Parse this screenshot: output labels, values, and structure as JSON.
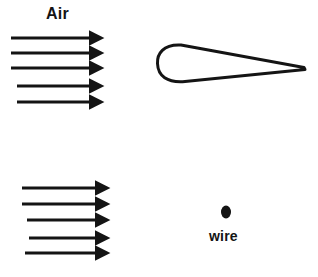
{
  "figure": {
    "width": 318,
    "height": 277,
    "background_color": "#ffffff",
    "ink_color": "#141414",
    "labels": {
      "air": "Air",
      "wire": "wire"
    },
    "icons": {
      "airfoil": "airfoil-outline-icon",
      "wire_dot": "wire-dot-icon",
      "flow_arrow": "flow-arrow-icon"
    },
    "upper_flow": {
      "name": "upper-airflow-arrows",
      "count": 5,
      "arrows": [
        {
          "x1": 11,
          "y1": 38,
          "x2": 96,
          "y2": 38
        },
        {
          "x1": 11,
          "y1": 53,
          "x2": 96,
          "y2": 53
        },
        {
          "x1": 11,
          "y1": 68,
          "x2": 96,
          "y2": 68
        },
        {
          "x1": 17,
          "y1": 86,
          "x2": 96,
          "y2": 86
        },
        {
          "x1": 17,
          "y1": 102,
          "x2": 96,
          "y2": 102
        }
      ]
    },
    "lower_flow": {
      "name": "lower-airflow-arrows",
      "count": 5,
      "arrows": [
        {
          "x1": 22,
          "y1": 188,
          "x2": 102,
          "y2": 188
        },
        {
          "x1": 22,
          "y1": 204,
          "x2": 102,
          "y2": 204
        },
        {
          "x1": 27,
          "y1": 220,
          "x2": 102,
          "y2": 220
        },
        {
          "x1": 29,
          "y1": 238,
          "x2": 102,
          "y2": 238
        },
        {
          "x1": 25,
          "y1": 253,
          "x2": 102,
          "y2": 253
        }
      ]
    },
    "airfoil": {
      "name": "airfoil-cross-section",
      "leading_edge_x": 157,
      "trailing_edge_x": 305,
      "trailing_edge_y": 68,
      "upper_peak_y": 45,
      "lower_peak_y": 82,
      "stroke_width": 3
    },
    "wire": {
      "name": "wire-cross-section",
      "center_x": 226,
      "center_y": 212,
      "radius_x": 5,
      "radius_y": 6.5
    }
  }
}
